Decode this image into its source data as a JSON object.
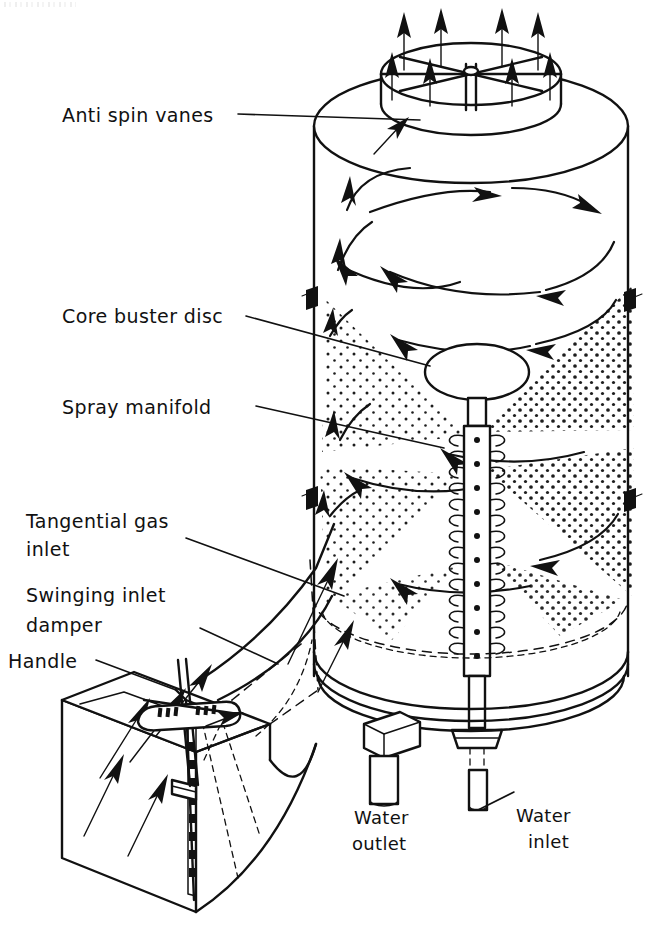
{
  "figure": {
    "background_color": "#ffffff",
    "ink_color": "#111111",
    "width": 652,
    "height": 935
  },
  "labels": {
    "anti_spin_vanes": "Anti spin vanes",
    "core_buster_disc": "Core buster disc",
    "spray_manifold": "Spray manifold",
    "tangential_gas_inlet_line1": "Tangential gas",
    "tangential_gas_inlet_line2": "inlet",
    "swinging_inlet_damper_line1": "Swinging inlet",
    "swinging_inlet_damper_line2": "damper",
    "handle": "Handle",
    "water_outlet_line1": "Water",
    "water_outlet_line2": "outlet",
    "water_inlet_line1": "Water",
    "water_inlet_line2": "inlet"
  },
  "components": [
    {
      "name": "anti-spin-vanes",
      "label": "Anti spin vanes",
      "description": "Radial vane spider inside top outlet stack"
    },
    {
      "name": "core-buster-disc",
      "label": "Core buster disc",
      "description": "Elliptical disc atop the spray manifold riser"
    },
    {
      "name": "spray-manifold",
      "label": "Spray manifold",
      "description": "Central vertical pipe with nozzle rings"
    },
    {
      "name": "tangential-gas-inlet",
      "label": "Tangential gas inlet",
      "description": "Rectangular duct entering the shell tangentially"
    },
    {
      "name": "swinging-inlet-damper",
      "label": "Swinging inlet damper",
      "description": "Pivoting blade in the inlet duct"
    },
    {
      "name": "handle",
      "label": "Handle",
      "description": "Lever controlling the swinging damper"
    },
    {
      "name": "water-outlet",
      "label": "Water outlet",
      "description": "Drain nozzle on the vessel base flange"
    },
    {
      "name": "water-inlet",
      "label": "Water inlet",
      "description": "Feed pipe entering the base to the manifold"
    },
    {
      "name": "vessel-shell",
      "label": "Vessel shell",
      "description": "Cylindrical cyclonic scrubber body"
    },
    {
      "name": "gas-outlet-stack",
      "label": "Gas outlet stack",
      "description": "Top cylindrical outlet with upward flow arrows"
    }
  ],
  "flow": {
    "gas_outlet_arrow_count": 8,
    "inlet_arrow_count": 5,
    "swirl_arrow_count": 9,
    "spray_cone_count": 4
  }
}
